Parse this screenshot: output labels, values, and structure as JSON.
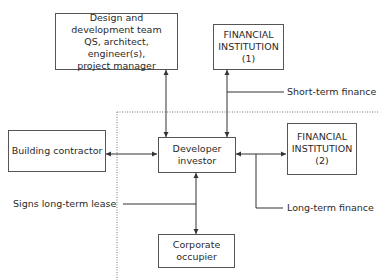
{
  "diagram": {
    "nodes": {
      "design_team": [
        "Design and",
        "development team",
        "QS, architect, engineer(s),",
        "project manager"
      ],
      "financial_institution_1": [
        "FINANCIAL",
        "INSTITUTION",
        "(1)"
      ],
      "building_contractor": [
        "Building contractor"
      ],
      "developer_investor": [
        "Developer",
        "investor"
      ],
      "financial_institution_2": [
        "FINANCIAL",
        "INSTITUTION",
        "(2)"
      ],
      "corporate_occupier": [
        "Corporate",
        "occupier"
      ]
    },
    "labels": {
      "short_term_finance": "Short-term finance",
      "long_term_finance": "Long-term finance",
      "signs_lease": "Signs long-term lease"
    },
    "edges": [
      {
        "from": "design_team",
        "to": "developer_investor",
        "type": "bidirectional"
      },
      {
        "from": "financial_institution_1",
        "to": "developer_investor",
        "type": "bidirectional",
        "label": "Short-term finance"
      },
      {
        "from": "building_contractor",
        "to": "developer_investor",
        "type": "bidirectional"
      },
      {
        "from": "developer_investor",
        "to": "financial_institution_2",
        "type": "bidirectional",
        "label": "Long-term finance"
      },
      {
        "from": "developer_investor",
        "to": "corporate_occupier",
        "type": "bidirectional",
        "label": "Signs long-term lease"
      }
    ]
  }
}
